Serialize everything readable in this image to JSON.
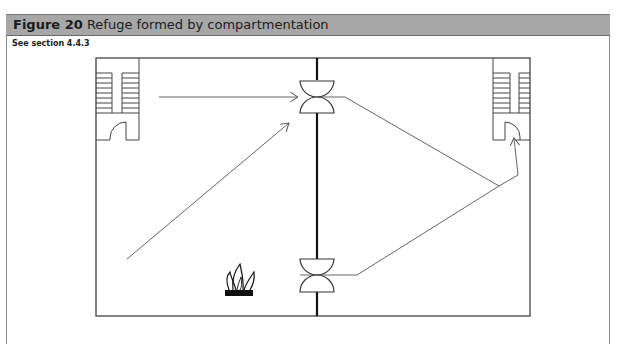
{
  "figure": {
    "label": "Figure 20",
    "title": "Refuge formed by compartmentation",
    "reference": "See section 4.4.3"
  },
  "diagram": {
    "elements": [
      {
        "name": "building-outline",
        "type": "rectangle"
      },
      {
        "name": "compartment-wall",
        "type": "fire-resisting-wall"
      },
      {
        "name": "stair-left",
        "type": "protected-stair"
      },
      {
        "name": "stair-right",
        "type": "protected-stair"
      },
      {
        "name": "door-upper",
        "type": "fire-door"
      },
      {
        "name": "door-lower",
        "type": "fire-door"
      },
      {
        "name": "fire-symbol",
        "type": "fire-icon"
      },
      {
        "name": "escape-routes",
        "type": "arrows"
      }
    ],
    "colors": {
      "title_bar": "#a7a7a7",
      "line": "#333333",
      "wall": "#111111",
      "route": "#555555"
    }
  }
}
